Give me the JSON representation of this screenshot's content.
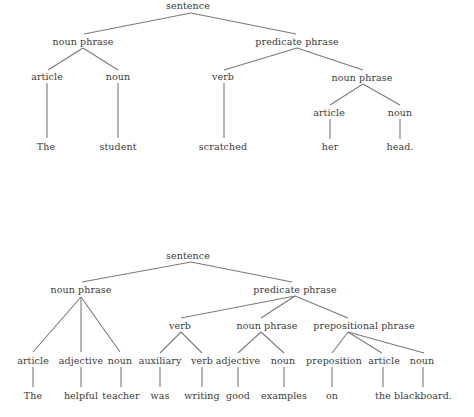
{
  "diagrams": [
    {
      "name": "tree-1",
      "sentence": "The student scratched her head.",
      "nodes": [
        {
          "id": "s",
          "label": "sentence",
          "x": 188,
          "y": 5
        },
        {
          "id": "np",
          "label": "noun phrase",
          "x": 83,
          "y": 41
        },
        {
          "id": "pp",
          "label": "predicate phrase",
          "x": 297,
          "y": 41
        },
        {
          "id": "art",
          "label": "article",
          "x": 47,
          "y": 76
        },
        {
          "id": "noun",
          "label": "noun",
          "x": 118,
          "y": 76
        },
        {
          "id": "verb",
          "label": "verb",
          "x": 223,
          "y": 76
        },
        {
          "id": "np2",
          "label": "noun phrase",
          "x": 362,
          "y": 77
        },
        {
          "id": "art2",
          "label": "article",
          "x": 329,
          "y": 112
        },
        {
          "id": "noun2",
          "label": "noun",
          "x": 400,
          "y": 112
        },
        {
          "id": "w1",
          "label": "The",
          "x": 46,
          "y": 146
        },
        {
          "id": "w2",
          "label": "student",
          "x": 118,
          "y": 146
        },
        {
          "id": "w3",
          "label": "scratched",
          "x": 223,
          "y": 146
        },
        {
          "id": "w4",
          "label": "her",
          "x": 330,
          "y": 146
        },
        {
          "id": "w5",
          "label": "head.",
          "x": 400,
          "y": 146
        }
      ],
      "edges": [
        [
          191,
          13,
          84,
          34
        ],
        [
          191,
          13,
          296,
          34
        ],
        [
          83,
          48,
          48,
          70
        ],
        [
          83,
          48,
          118,
          70
        ],
        [
          297,
          48,
          224,
          70
        ],
        [
          297,
          48,
          363,
          70
        ],
        [
          363,
          84,
          330,
          105
        ],
        [
          363,
          84,
          400,
          105
        ],
        [
          47,
          83,
          47,
          138
        ],
        [
          118,
          83,
          118,
          138
        ],
        [
          224,
          83,
          224,
          138
        ],
        [
          330,
          119,
          330,
          139
        ],
        [
          400,
          119,
          400,
          139
        ]
      ]
    },
    {
      "name": "tree-2",
      "sentence": "The helpful teacher was writing good examples on the blackboard.",
      "nodes": [
        {
          "id": "s",
          "label": "sentence",
          "x": 188,
          "y": 255
        },
        {
          "id": "np",
          "label": "noun phrase",
          "x": 81,
          "y": 289
        },
        {
          "id": "pp",
          "label": "predicate phrase",
          "x": 295,
          "y": 289
        },
        {
          "id": "v",
          "label": "verb",
          "x": 180,
          "y": 325
        },
        {
          "id": "np2",
          "label": "noun phrase",
          "x": 267,
          "y": 325
        },
        {
          "id": "prp",
          "label": "prepositional phrase",
          "x": 364,
          "y": 325
        },
        {
          "id": "art",
          "label": "article",
          "x": 33,
          "y": 360
        },
        {
          "id": "adj",
          "label": "adjective",
          "x": 81,
          "y": 360
        },
        {
          "id": "noun",
          "label": "noun",
          "x": 120,
          "y": 360
        },
        {
          "id": "aux",
          "label": "auxiliary",
          "x": 160,
          "y": 360
        },
        {
          "id": "verb",
          "label": "verb",
          "x": 202,
          "y": 360
        },
        {
          "id": "adj2",
          "label": "adjective",
          "x": 238,
          "y": 360
        },
        {
          "id": "noun2",
          "label": "noun",
          "x": 283,
          "y": 360
        },
        {
          "id": "prep",
          "label": "preposition",
          "x": 334,
          "y": 360
        },
        {
          "id": "art2",
          "label": "article",
          "x": 384,
          "y": 360
        },
        {
          "id": "noun3",
          "label": "noun",
          "x": 422,
          "y": 360
        },
        {
          "id": "w1",
          "label": "The",
          "x": 33,
          "y": 395
        },
        {
          "id": "w2",
          "label": "helpful",
          "x": 81,
          "y": 395
        },
        {
          "id": "w3",
          "label": "teacher",
          "x": 121,
          "y": 395
        },
        {
          "id": "w4",
          "label": "was",
          "x": 160,
          "y": 395
        },
        {
          "id": "w5",
          "label": "writing",
          "x": 202,
          "y": 395
        },
        {
          "id": "w6",
          "label": "good",
          "x": 238,
          "y": 395
        },
        {
          "id": "w7",
          "label": "examples",
          "x": 284,
          "y": 395
        },
        {
          "id": "w8",
          "label": "on",
          "x": 332,
          "y": 395
        },
        {
          "id": "w9",
          "label": "the",
          "x": 383,
          "y": 395
        },
        {
          "id": "w10",
          "label": "blackboard.",
          "x": 423,
          "y": 395
        }
      ],
      "edges": [
        [
          191,
          262,
          82,
          282
        ],
        [
          191,
          262,
          292,
          282
        ],
        [
          81,
          297,
          33,
          352
        ],
        [
          81,
          297,
          81,
          352
        ],
        [
          81,
          297,
          120,
          352
        ],
        [
          295,
          296,
          181,
          318
        ],
        [
          295,
          296,
          261,
          318
        ],
        [
          295,
          296,
          348,
          318
        ],
        [
          181,
          332,
          160,
          353
        ],
        [
          181,
          332,
          202,
          353
        ],
        [
          261,
          332,
          238,
          353
        ],
        [
          261,
          332,
          284,
          353
        ],
        [
          348,
          332,
          332,
          353
        ],
        [
          348,
          332,
          382,
          353
        ],
        [
          348,
          332,
          424,
          353
        ],
        [
          33,
          367,
          33,
          387
        ],
        [
          81,
          367,
          81,
          387
        ],
        [
          121,
          367,
          121,
          387
        ],
        [
          160,
          367,
          160,
          387
        ],
        [
          202,
          367,
          202,
          387
        ],
        [
          238,
          367,
          238,
          387
        ],
        [
          284,
          367,
          284,
          387
        ],
        [
          332,
          367,
          332,
          387
        ],
        [
          383,
          367,
          383,
          387
        ],
        [
          423,
          367,
          423,
          387
        ]
      ]
    }
  ],
  "colors": {
    "line": "#7a7a7a",
    "text": "#3a3a3a",
    "background": "#ffffff"
  }
}
